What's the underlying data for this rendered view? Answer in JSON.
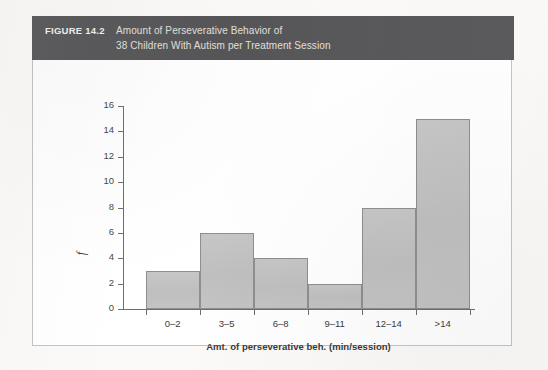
{
  "figure": {
    "number_label": "FIGURE 14.2",
    "title_line_1": "Amount of Perseverative Behavior of",
    "title_line_2": "38 Children With Autism per Treatment Session",
    "header_color": "#58575a",
    "header_text_color": "#e2e0dd",
    "body_background": "#ffffff",
    "border_color": "#c5c4c2"
  },
  "chart_data": {
    "type": "bar",
    "title": "Amount of Perseverative Behavior of 38 Children With Autism per Treatment Session",
    "categories": [
      "0–2",
      "3–5",
      "6–8",
      "9–11",
      "12–14",
      ">14"
    ],
    "values": [
      3,
      6,
      4,
      2,
      8,
      15
    ],
    "xlabel": "Amt. of perseverative beh. (min/session)",
    "ylabel": "f",
    "ylim": [
      0,
      16
    ],
    "ytick_step": 2,
    "yticks": [
      "0",
      "2",
      "4",
      "6",
      "8",
      "10",
      "12",
      "14",
      "16"
    ],
    "grid": false,
    "legend": false,
    "bar_fill_color": "#c2c2c2",
    "bar_border_color": "#8f8e8d",
    "axis_color": "#6f6e6c",
    "total": 38
  }
}
